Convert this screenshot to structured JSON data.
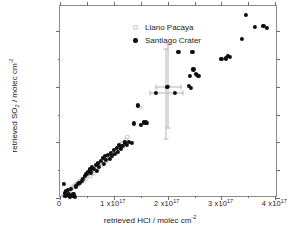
{
  "chart_data": {
    "type": "scatter",
    "title": "",
    "xlabel": "retrieved HCl / molec cm⁻²",
    "ylabel": "retrieved SO₂ / molec cm⁻²",
    "xlim": [
      0,
      4.05e+17
    ],
    "ylim": [
      0,
      6.9e+17
    ],
    "grid": false,
    "legend_position": "top-left",
    "x_ticks": [
      {
        "value": 0,
        "label": "0"
      },
      {
        "value": 1e+17,
        "label": "1 x10",
        "exp": "17"
      },
      {
        "value": 2e+17,
        "label": "2 x10",
        "exp": "17"
      },
      {
        "value": 3e+17,
        "label": "3 x10",
        "exp": "17"
      },
      {
        "value": 4e+17,
        "label": "4 x10",
        "exp": "17"
      }
    ],
    "x_minor_ticks": [
      5e+16,
      1.5e+17,
      2.5e+17,
      3.5e+17
    ],
    "y_ticks": [
      {
        "value": 0,
        "label": "0"
      },
      {
        "value": 2e+17,
        "label": "2 x10",
        "exp": "17"
      },
      {
        "value": 4e+17,
        "label": "4 x10",
        "exp": "17"
      },
      {
        "value": 6e+17,
        "label": "6 x10",
        "exp": "17"
      }
    ],
    "y_minor_ticks": [
      1e+17,
      3e+17,
      5e+17
    ],
    "series": [
      {
        "name": "Llano Pacaya",
        "marker": "open-circle",
        "color": "#c4c4c4",
        "points": [
          [
            5500000000000000.0,
            8000000000000000.0
          ],
          [
            7000000000000000.0,
            1e+16
          ],
          [
            8500000000000000.0,
            1.2e+16
          ],
          [
            1e+16,
            1.4e+16
          ],
          [
            1.1e+16,
            1.7e+16
          ],
          [
            1.25e+16,
            1.9e+16
          ],
          [
            1.4e+16,
            2.1e+16
          ],
          [
            1.5e+16,
            2.3e+16
          ],
          [
            1.6e+16,
            2.5e+16
          ],
          [
            1.7e+16,
            2.8e+16
          ],
          [
            1.85e+16,
            3e+16
          ],
          [
            2e+16,
            3.2e+16
          ],
          [
            2.15e+16,
            3.5e+16
          ],
          [
            2.3e+16,
            3.7e+16
          ],
          [
            2.45e+16,
            4e+16
          ],
          [
            2.6e+16,
            4.2e+16
          ],
          [
            2.75e+16,
            4.5e+16
          ],
          [
            2.9e+16,
            4.7e+16
          ],
          [
            3.05e+16,
            5e+16
          ],
          [
            3.2e+16,
            5.2e+16
          ],
          [
            3.35e+16,
            5.5e+16
          ],
          [
            3.5e+16,
            5.7e+16
          ],
          [
            3.65e+16,
            6e+16
          ],
          [
            3.8e+16,
            6.2e+16
          ],
          [
            4e+16,
            6.5e+16
          ],
          [
            4.15e+16,
            6.7e+16
          ],
          [
            4.3e+16,
            7e+16
          ],
          [
            4.45e+16,
            7.3e+16
          ],
          [
            4.6e+16,
            7.5e+16
          ],
          [
            4.8e+16,
            7.8e+16
          ],
          [
            5e+16,
            8.1e+16
          ],
          [
            5.15e+16,
            8.4e+16
          ],
          [
            5.3e+16,
            8.6e+16
          ],
          [
            5.5e+16,
            8.9e+16
          ],
          [
            5.65e+16,
            9.2e+16
          ],
          [
            5.8e+16,
            9.5e+16
          ],
          [
            6e+16,
            9.7e+16
          ],
          [
            6.2e+16,
            1e+17
          ],
          [
            6.35e+16,
            1.03e+17
          ],
          [
            6.5e+16,
            1.06e+17
          ],
          [
            6.7e+16,
            1.09e+17
          ],
          [
            6.9e+16,
            1.12e+17
          ],
          [
            7.05e+16,
            1.15e+17
          ],
          [
            7.2e+16,
            1.18e+17
          ],
          [
            7.4e+16,
            1.21e+17
          ],
          [
            7.6e+16,
            1.24e+17
          ],
          [
            7.8e+16,
            1.27e+17
          ],
          [
            7.95e+16,
            1.3e+17
          ],
          [
            8.1e+16,
            1.33e+17
          ],
          [
            8.3e+16,
            1.36e+17
          ],
          [
            8.5e+16,
            1.39e+17
          ],
          [
            8.7e+16,
            1.42e+17
          ],
          [
            8.9e+16,
            1.45e+17
          ],
          [
            9.05e+16,
            1.48e+17
          ],
          [
            9.2e+16,
            1.51e+17
          ],
          [
            9.4e+16,
            1.55e+17
          ],
          [
            9.6e+16,
            1.58e+17
          ],
          [
            9.8e+16,
            1.61e+17
          ],
          [
            1e+17,
            1.65e+17
          ],
          [
            1.02e+17,
            1.68e+17
          ],
          [
            1.04e+17,
            1.72e+17
          ],
          [
            1.06e+17,
            1.76e+17
          ],
          [
            1.08e+17,
            1.8e+17
          ],
          [
            1.1e+17,
            1.84e+17
          ],
          [
            1.12e+17,
            1.88e+17
          ],
          [
            1.14e+17,
            1.93e+17
          ],
          [
            1.16e+17,
            1.98e+17
          ],
          [
            1.19e+17,
            2.03e+17
          ],
          [
            1.22e+17,
            2.1e+17
          ],
          [
            1.25e+17,
            2.2e+17
          ],
          [
            1.5e+17,
            3.25e+17
          ],
          [
            3e+16,
            4e+16
          ],
          [
            3.5e+16,
            4.8e+16
          ],
          [
            4.2e+16,
            5.8e+16
          ],
          [
            4.8e+16,
            6.6e+16
          ],
          [
            5.5e+16,
            7.8e+16
          ],
          [
            6.2e+16,
            8.8e+16
          ],
          [
            7e+16,
            1.02e+17
          ],
          [
            7.8e+16,
            1.16e+17
          ],
          [
            8.6e+16,
            1.3e+17
          ],
          [
            9.5e+16,
            1.48e+17
          ],
          [
            1.05e+17,
            1.62e+17
          ],
          [
            1.13e+17,
            1.82e+17
          ]
        ]
      },
      {
        "name": "Santiago Crater",
        "marker": "filled-circle",
        "color": "#0d0d0d",
        "points": [
          [
            7000000000000000.0,
            5.2e+16
          ],
          [
            9000000000000000.0,
            1.8e+16
          ],
          [
            1e+16,
            7000000000000000.0
          ],
          [
            1.15e+16,
            2.4e+16
          ],
          [
            1.3e+16,
            1e+16
          ],
          [
            1.5e+16,
            3e+16
          ],
          [
            1.7e+16,
            1.3e+16
          ],
          [
            1.9e+16,
            5000000000000000.0
          ],
          [
            2.1e+16,
            3.4e+16
          ],
          [
            2.3e+16,
            7000000000000000.0
          ],
          [
            2.5e+16,
            1.3e+16
          ],
          [
            2.7e+16,
            5000000000000000.0
          ],
          [
            3e+16,
            4.2e+16
          ],
          [
            3.3e+16,
            5e+16
          ],
          [
            3.6e+16,
            5.5e+16
          ],
          [
            4e+16,
            6.2e+16
          ],
          [
            4.3e+16,
            7e+16
          ],
          [
            4.6e+16,
            8e+16
          ],
          [
            4.9e+16,
            8.6e+16
          ],
          [
            5.2e+16,
            9.5e+16
          ],
          [
            5.5e+16,
            1.03e+17
          ],
          [
            5.7e+16,
            9.2e+16
          ],
          [
            6e+16,
            1.1e+17
          ],
          [
            6.3e+16,
            1.04e+17
          ],
          [
            6.6e+16,
            1.18e+17
          ],
          [
            6.8e+16,
            9.8e+16
          ],
          [
            7e+16,
            1.24e+17
          ],
          [
            7.3e+16,
            1.12e+17
          ],
          [
            7.6e+16,
            1.32e+17
          ],
          [
            7.9e+16,
            1.44e+17
          ],
          [
            8.1e+16,
            1.22e+17
          ],
          [
            8.4e+16,
            1.5e+17
          ],
          [
            8.6e+16,
            1.36e+17
          ],
          [
            8.9e+16,
            1.56e+17
          ],
          [
            9.2e+16,
            1.4e+17
          ],
          [
            9.5e+16,
            1.62e+17
          ],
          [
            9.7e+16,
            1.5e+17
          ],
          [
            1e+17,
            1.72e+17
          ],
          [
            1.02e+17,
            1.58e+17
          ],
          [
            1.05e+17,
            1.8e+17
          ],
          [
            1.08e+17,
            1.66e+17
          ],
          [
            1.1e+17,
            1.92e+17
          ],
          [
            1.13e+17,
            1.78e+17
          ],
          [
            1.16e+17,
            1.86e+17
          ],
          [
            1.2e+17,
            2e+17
          ],
          [
            1.24e+17,
            1.92e+17
          ],
          [
            1.28e+17,
            2.02e+17
          ],
          [
            1.33e+17,
            1.97e+17
          ],
          [
            1.37e+17,
            2.68e+17
          ],
          [
            1.44e+17,
            3.33e+17
          ],
          [
            1.5e+17,
            2.64e+17
          ],
          [
            1.56e+17,
            2.72e+17
          ],
          [
            1.6e+17,
            2.72e+17
          ],
          [
            1.62e+17,
            2.7e+17
          ],
          [
            1.78e+17,
            3.78e+17
          ],
          [
            1.98e+17,
            4e+17
          ],
          [
            2.13e+17,
            3.78e+17
          ],
          [
            2.2e+17,
            5.25e+17
          ],
          [
            2.4e+17,
            4.02e+17
          ],
          [
            2.42e+17,
            4.38e+17
          ],
          [
            2.43e+17,
            3.95e+17
          ],
          [
            2.46e+17,
            5.25e+17
          ],
          [
            2.48e+17,
            4.62e+17
          ],
          [
            2.52e+17,
            4.45e+17
          ],
          [
            2.55e+17,
            4.42e+17
          ],
          [
            2.57e+17,
            4.38e+17
          ],
          [
            3e+17,
            5e+17
          ],
          [
            3.08e+17,
            5.02e+17
          ],
          [
            3.12e+17,
            5.1e+17
          ],
          [
            3.15e+17,
            5.08e+17
          ],
          [
            3.38e+17,
            5.72e+17
          ],
          [
            3.46e+17,
            6.58e+17
          ],
          [
            3.62e+17,
            6.16e+17
          ],
          [
            3.78e+17,
            6.18e+17
          ],
          [
            3.84e+17,
            6.1e+17
          ]
        ]
      }
    ],
    "error_bars": [
      {
        "x": 2e+17,
        "y": 4e+17,
        "x_err_low": 1.78e+17,
        "x_err_high": 2.24e+17,
        "y_err_low": 2.5e+17,
        "y_err_high": 5.52e+17,
        "color": "#b3b3b3",
        "has_center_marker": true
      },
      {
        "x": 1.96e+17,
        "y": 3.79e+17,
        "x_err_low": 1.68e+17,
        "x_err_high": 2.28e+17,
        "y_err_low": 2.12e+17,
        "y_err_high": 5.35e+17,
        "color": "#b3b3b3",
        "has_center_marker": false
      }
    ]
  },
  "axes": {
    "x_title": "retrieved HCl / molec cm",
    "x_title_sup": "-2",
    "y_title_pre": "retrieved SO",
    "y_title_sub": "2",
    "y_title_post": " / molec cm",
    "y_title_sup": "-2"
  },
  "legend": {
    "entries": [
      {
        "label": "Llano Pacaya",
        "marker": "open-circle"
      },
      {
        "label": "Santiago Crater",
        "marker": "filled-circle"
      }
    ]
  }
}
